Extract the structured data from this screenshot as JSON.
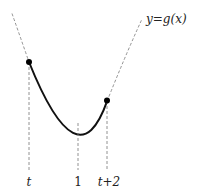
{
  "diagram": {
    "curve_label": "y=g(x)",
    "curve_label_parts": {
      "y": "y",
      "eq": "=",
      "g": "g(x)"
    },
    "function": "g(x), parabola with minimum at x = 1",
    "highlighted_interval": [
      "t",
      "t+2"
    ],
    "x_labels": [
      {
        "id": "t",
        "text": "t"
      },
      {
        "id": "one",
        "text": "1"
      },
      {
        "id": "t_plus_2",
        "text": "t+2"
      }
    ],
    "points": [
      {
        "name": "left-endpoint",
        "x_label": "t"
      },
      {
        "name": "right-endpoint",
        "x_label": "t+2"
      }
    ],
    "vertex_x_label": "1",
    "colors": {
      "curve": "#111111",
      "dashed": "#777777",
      "text": "#222222"
    }
  }
}
